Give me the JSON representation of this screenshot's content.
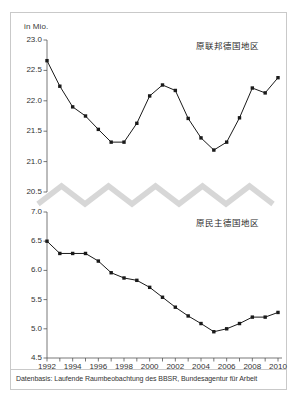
{
  "figure": {
    "unit_label": "in Mio.",
    "source_note": "Datenbasis: Laufende Raumbeobachtung des BBSR, Bundesagentur für Arbeit",
    "frame_color": "#c9c9c9",
    "background_color": "#ffffff",
    "axis_break_color": "#d7d7d7",
    "series_color": "#1a1a1a"
  },
  "chart_data": {
    "type": "line",
    "title": "",
    "subtitle": "",
    "xlabel": "",
    "ylabel": "in Mio.",
    "grid": false,
    "legend_position": "inline-right",
    "axis_break": {
      "present": true,
      "style": "zigzag",
      "between": [
        7.0,
        20.5
      ]
    },
    "x": [
      1992,
      1993,
      1994,
      1995,
      1996,
      1997,
      1998,
      1999,
      2000,
      2001,
      2002,
      2003,
      2004,
      2005,
      2006,
      2007,
      2008,
      2009,
      2010
    ],
    "xtick_labels": [
      "1992",
      "1994",
      "1996",
      "1998",
      "2000",
      "2002",
      "2004",
      "2006",
      "2008",
      "2010"
    ],
    "xtick_values": [
      1992,
      1994,
      1996,
      1998,
      2000,
      2002,
      2004,
      2006,
      2008,
      2010
    ],
    "panels": [
      {
        "name": "upper",
        "series_name": "原联邦德国地区",
        "ylim": [
          20.5,
          23.0
        ],
        "ytick_labels": [
          "23.0",
          "22.5",
          "22.0",
          "21.5",
          "21.0",
          "20.5"
        ],
        "ytick_values": [
          23.0,
          22.5,
          22.0,
          21.5,
          21.0,
          20.5
        ],
        "values": [
          22.66,
          22.24,
          21.9,
          21.75,
          21.53,
          21.32,
          21.32,
          21.63,
          22.08,
          22.26,
          22.17,
          21.71,
          21.39,
          21.19,
          21.32,
          21.72,
          22.21,
          22.13,
          22.38
        ]
      },
      {
        "name": "lower",
        "series_name": "原民主德国地区",
        "ylim": [
          4.5,
          7.0
        ],
        "ytick_labels": [
          "7.0",
          "6.5",
          "6.0",
          "5.5",
          "5.0",
          "4.5"
        ],
        "ytick_values": [
          7.0,
          6.5,
          6.0,
          5.5,
          5.0,
          4.5
        ],
        "values": [
          6.5,
          6.29,
          6.29,
          6.29,
          6.16,
          5.96,
          5.87,
          5.83,
          5.71,
          5.54,
          5.37,
          5.22,
          5.09,
          4.95,
          5.0,
          5.09,
          5.2,
          5.2,
          5.28
        ]
      }
    ]
  }
}
